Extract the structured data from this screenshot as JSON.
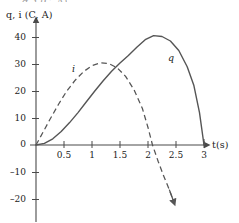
{
  "figure": {
    "background_color": "#ffffff",
    "axis_color": "#4a4a4a",
    "curve_color": "#555555",
    "text_color": "#1c1c1c",
    "top_crop_fragment": "q, i (C, A)"
  },
  "chart_data": {
    "type": "line",
    "title": "",
    "subtitle": "",
    "xlabel": "t(s)",
    "ylabel": "q, i (C, A)",
    "xlim": [
      0,
      3.2
    ],
    "ylim": [
      -22,
      44
    ],
    "grid": false,
    "legend": "inline-curve-labels",
    "xticks": [
      0.5,
      1,
      1.5,
      2,
      2.5,
      3
    ],
    "xtick_labels": [
      "0.5",
      "1",
      "1.5",
      "2",
      "2.5",
      "3"
    ],
    "yticks": [
      40,
      30,
      20,
      10,
      0,
      -10,
      -20
    ],
    "ytick_labels": [
      "40",
      "30",
      "20",
      "10",
      "0",
      "–10",
      "–20"
    ],
    "origin_label": "0",
    "series": [
      {
        "name": "q",
        "label": "q",
        "style": "solid",
        "units": "C",
        "peak": {
          "x": 2.1,
          "y": 40.5
        },
        "zeros": [
          0,
          3
        ],
        "points": [
          [
            0.0,
            0.0
          ],
          [
            0.15,
            0.6
          ],
          [
            0.3,
            2.3
          ],
          [
            0.45,
            5.0
          ],
          [
            0.6,
            8.3
          ],
          [
            0.75,
            12.0
          ],
          [
            0.9,
            16.0
          ],
          [
            1.05,
            20.0
          ],
          [
            1.2,
            23.8
          ],
          [
            1.35,
            27.3
          ],
          [
            1.5,
            30.4
          ],
          [
            1.65,
            33.2
          ],
          [
            1.8,
            36.2
          ],
          [
            1.95,
            39.0
          ],
          [
            2.1,
            40.5
          ],
          [
            2.25,
            40.2
          ],
          [
            2.4,
            38.5
          ],
          [
            2.55,
            35.0
          ],
          [
            2.7,
            29.0
          ],
          [
            2.82,
            22.0
          ],
          [
            2.92,
            12.0
          ],
          [
            3.0,
            0.0
          ]
        ]
      },
      {
        "name": "i",
        "label": "i",
        "style": "dashed",
        "units": "A",
        "peak": {
          "x": 1.2,
          "y": 30.5
        },
        "zeros": [
          0,
          2.08
        ],
        "arrow_end": {
          "x": 2.45,
          "y": -20.5
        },
        "points": [
          [
            0.0,
            0.0
          ],
          [
            0.12,
            4.5
          ],
          [
            0.25,
            9.5
          ],
          [
            0.4,
            15.0
          ],
          [
            0.55,
            20.0
          ],
          [
            0.7,
            24.0
          ],
          [
            0.85,
            27.2
          ],
          [
            1.0,
            29.4
          ],
          [
            1.15,
            30.4
          ],
          [
            1.3,
            30.2
          ],
          [
            1.45,
            28.6
          ],
          [
            1.6,
            25.4
          ],
          [
            1.75,
            20.5
          ],
          [
            1.9,
            13.5
          ],
          [
            2.0,
            6.5
          ],
          [
            2.08,
            0.0
          ],
          [
            2.18,
            -6.0
          ],
          [
            2.28,
            -11.5
          ],
          [
            2.38,
            -16.5
          ],
          [
            2.45,
            -20.5
          ]
        ]
      }
    ]
  }
}
